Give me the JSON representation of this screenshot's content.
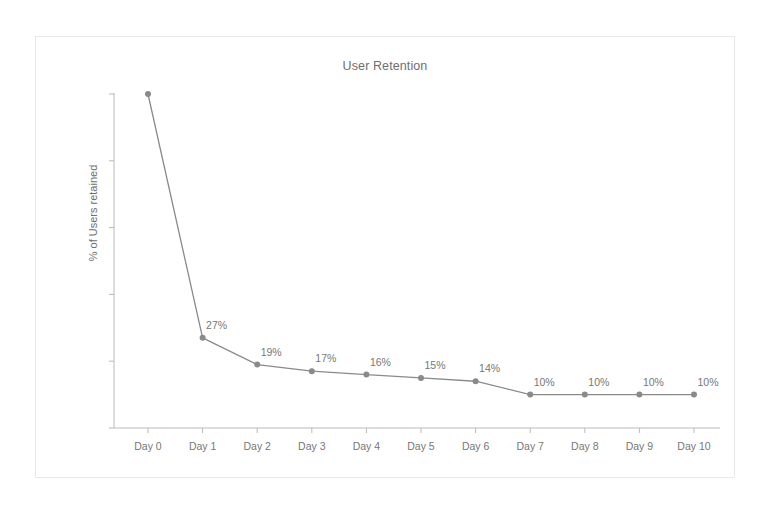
{
  "chart_data": {
    "type": "line",
    "title": "User Retention",
    "xlabel": "",
    "ylabel": "% of Users retained",
    "categories": [
      "Day 0",
      "Day 1",
      "Day 2",
      "Day 3",
      "Day 4",
      "Day 5",
      "Day 6",
      "Day 7",
      "Day 8",
      "Day 9",
      "Day 10"
    ],
    "values": [
      100,
      27,
      19,
      17,
      16,
      15,
      14,
      10,
      10,
      10,
      10
    ],
    "point_labels": [
      "",
      "27%",
      "19%",
      "17%",
      "16%",
      "15%",
      "14%",
      "10%",
      "10%",
      "10%",
      "10%"
    ],
    "ylim": [
      0,
      100
    ],
    "y_ticks": [
      0,
      20,
      40,
      60,
      80,
      100
    ],
    "y_tick_labels": [
      "0%",
      "20%",
      "40%",
      "60%",
      "80%",
      "100%"
    ],
    "grid": false,
    "legend": "none",
    "series": [
      {
        "name": "Retention",
        "values": [
          100,
          27,
          19,
          17,
          16,
          15,
          14,
          10,
          10,
          10,
          10
        ],
        "color": "#8a8a8a",
        "marker": "circle",
        "marker_color": "#8a8a8a"
      }
    ],
    "colors": {
      "line": "#8a8a8a",
      "marker": "#8a8a8a",
      "axis": "#b9b9b9",
      "text": "#777777",
      "title_text": "#6e6e6e",
      "frame_border": "#e8e8e8",
      "background": "#ffffff"
    }
  }
}
